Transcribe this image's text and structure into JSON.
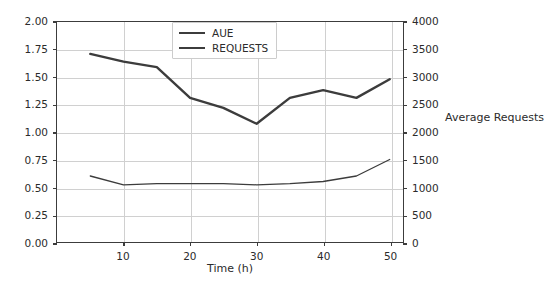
{
  "chart_data": {
    "type": "line",
    "title": "",
    "xlabel": "Time (h)",
    "ylabel": "Average User Experience[AUE]",
    "y2label": "Average Requests",
    "xlim": [
      0,
      52
    ],
    "ylim": [
      0.0,
      2.0
    ],
    "y2lim": [
      0,
      4000
    ],
    "grid": true,
    "legend_position": "upper center",
    "xticks": [
      10,
      20,
      30,
      40,
      50
    ],
    "xticklabels": [
      "10",
      "20",
      "30",
      "40",
      "50"
    ],
    "yticks": [
      0.0,
      0.25,
      0.5,
      0.75,
      1.0,
      1.25,
      1.5,
      1.75,
      2.0
    ],
    "yticklabels": [
      "0.00",
      "0.25",
      "0.50",
      "0.75",
      "1.00",
      "1.25",
      "1.50",
      "1.75",
      "2.00"
    ],
    "y2ticks": [
      0,
      500,
      1000,
      1500,
      2000,
      2500,
      3000,
      3500,
      4000
    ],
    "y2ticklabels": [
      "0",
      "500",
      "1000",
      "1500",
      "2000",
      "2500",
      "3000",
      "3500",
      "4000"
    ],
    "x": [
      5,
      10,
      15,
      20,
      25,
      30,
      35,
      40,
      45,
      50
    ],
    "series": [
      {
        "name": "AUE",
        "axis": "left",
        "color": "#3c3c3c",
        "linewidth": 1.3,
        "values": [
          0.6,
          0.52,
          0.53,
          0.53,
          0.53,
          0.52,
          0.53,
          0.55,
          0.6,
          0.75
        ]
      },
      {
        "name": "REQUESTS",
        "axis": "right",
        "color": "#3c3c3c",
        "linewidth": 2.4,
        "values": [
          3420,
          3280,
          3180,
          2620,
          2440,
          2150,
          2620,
          2760,
          2620,
          2960
        ]
      }
    ]
  },
  "legend": {
    "items": [
      {
        "label": "AUE",
        "style": "thin"
      },
      {
        "label": "REQUESTS",
        "style": "thick"
      }
    ]
  },
  "caption": {
    "text": ""
  }
}
